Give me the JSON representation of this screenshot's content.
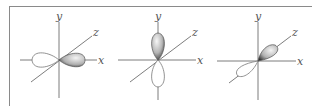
{
  "figure": {
    "panels": [
      {
        "name": "px",
        "axis_labels": {
          "x": "x",
          "y": "y",
          "z": "z"
        },
        "shaded_lobe": "+x",
        "unshaded_lobe": "-x"
      },
      {
        "name": "py",
        "axis_labels": {
          "x": "x",
          "y": "y",
          "z": "z"
        },
        "shaded_lobe": "+y",
        "unshaded_lobe": "-y"
      },
      {
        "name": "pz",
        "axis_labels": {
          "x": "x",
          "y": "y",
          "z": "z"
        },
        "shaded_lobe": "+z",
        "unshaded_lobe": "-z"
      }
    ]
  },
  "colors": {
    "axis": "#6e6e6e",
    "frame": "#8a8a8a",
    "lobe_outline": "#777777",
    "lobe_shade_dark": "#3a3a3a",
    "lobe_shade_light": "#f2f2f2"
  }
}
